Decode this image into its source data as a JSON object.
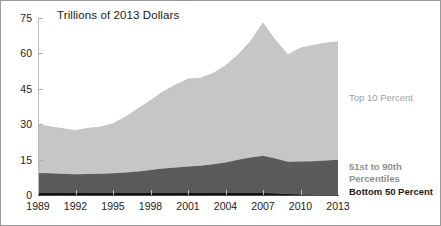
{
  "figure": {
    "plot_title": "Trillions of 2013 Dollars"
  },
  "axes": {
    "y_ticks": [
      "0",
      "15",
      "30",
      "45",
      "60",
      "75"
    ],
    "x_ticks": [
      "1989",
      "1992",
      "1995",
      "1998",
      "2001",
      "2004",
      "2007",
      "2010",
      "2013"
    ]
  },
  "legend": {
    "top10": "Top 10 Percent",
    "middle_line1": "51st to 90th",
    "middle_line2": "Percentiles",
    "bottom": "Bottom 50 Percent"
  },
  "colors": {
    "top10_fill": "#c6c6c6",
    "middle_fill": "#5b5b5b",
    "bottom_fill": "#111111",
    "axis": "#b6b6b6",
    "baseline": "#3f3f3f",
    "text": "#1c1c1c",
    "legend_gray": "#9b9b9b"
  },
  "chart_data": {
    "type": "area",
    "title": "Trillions of 2013 Dollars",
    "subtitle": "",
    "xlabel": "",
    "ylabel": "Trillions of 2013 Dollars",
    "ylim": [
      0,
      75
    ],
    "yticks": [
      0,
      15,
      30,
      45,
      60,
      75
    ],
    "grid": false,
    "legend_position": "right-inline",
    "stacked": true,
    "x": [
      1989,
      1990,
      1991,
      1992,
      1993,
      1994,
      1995,
      1996,
      1997,
      1998,
      1999,
      2000,
      2001,
      2002,
      2003,
      2004,
      2005,
      2006,
      2007,
      2008,
      2009,
      2010,
      2011,
      2012,
      2013
    ],
    "x_tick_labels": [
      "1989",
      "1992",
      "1995",
      "1998",
      "2001",
      "2004",
      "2007",
      "2010",
      "2013"
    ],
    "series": [
      {
        "name": "Bottom 50 Percent",
        "color": "#111111",
        "values": [
          0.8,
          0.8,
          0.8,
          0.8,
          0.8,
          0.8,
          0.8,
          0.8,
          0.8,
          0.8,
          0.8,
          0.8,
          0.8,
          0.8,
          0.8,
          0.8,
          0.9,
          0.9,
          0.9,
          0.7,
          0.4,
          0.3,
          0.2,
          0.2,
          0.2
        ]
      },
      {
        "name": "51st to 90th Percentiles",
        "color": "#5b5b5b",
        "values": [
          8.5,
          8.4,
          8.2,
          8.0,
          8.1,
          8.2,
          8.4,
          8.7,
          9.2,
          9.8,
          10.4,
          10.9,
          11.3,
          11.6,
          12.2,
          13.0,
          14.0,
          15.0,
          15.7,
          14.8,
          13.7,
          13.9,
          14.1,
          14.4,
          14.7
        ]
      },
      {
        "name": "Top 10 Percent",
        "color": "#c6c6c6",
        "values": [
          20.5,
          19.7,
          19.1,
          18.5,
          19.4,
          19.8,
          21.0,
          23.6,
          26.5,
          29.4,
          32.5,
          34.9,
          37.0,
          37.1,
          38.5,
          41.0,
          44.4,
          49.2,
          56.3,
          50.0,
          45.3,
          48.1,
          49.1,
          49.8,
          50.0
        ]
      }
    ],
    "stack_totals": [
      29.8,
      28.9,
      28.1,
      27.3,
      28.3,
      28.8,
      30.2,
      33.1,
      36.5,
      40.0,
      43.7,
      46.6,
      49.1,
      49.5,
      51.5,
      54.8,
      59.3,
      65.1,
      72.9,
      65.5,
      59.4,
      62.3,
      63.4,
      64.4,
      64.9
    ]
  }
}
